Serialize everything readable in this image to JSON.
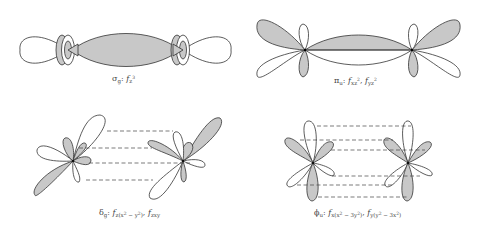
{
  "figure": {
    "type": "molecular-orbital-overlap-diagram",
    "colors": {
      "shaded": "#c8c8c8",
      "outline": "#333333",
      "background": "#ffffff",
      "dashed": "#444444"
    },
    "panels": [
      {
        "id": "sigma-g",
        "symmetry": "σ",
        "symmetry_sub": "g",
        "orbitals": [
          {
            "f": "f",
            "sub": "z",
            "sup": "3"
          }
        ],
        "description": "end-on overlap along the axis"
      },
      {
        "id": "pi-u",
        "symmetry": "π",
        "symmetry_sub": "u",
        "orbitals": [
          {
            "f": "f",
            "sub": "xz",
            "sup": "2"
          },
          {
            "f": "f",
            "sub": "yz",
            "sup": "2"
          }
        ],
        "description": "side-on lobe overlap"
      },
      {
        "id": "delta-g",
        "symmetry": "δ",
        "symmetry_sub": "g",
        "orbitals": [
          {
            "f": "f",
            "sub": "z(x",
            "sup": "2",
            "sub2": " − y",
            "sup2": "2",
            "sub3": ")"
          },
          {
            "f": "f",
            "sub": "zxy"
          }
        ],
        "description": "four dashed overlap lines"
      },
      {
        "id": "phi-u",
        "symmetry": "ϕ",
        "symmetry_sub": "u",
        "orbitals": [
          {
            "f": "f",
            "sub": "x(x",
            "sup": "2",
            "sub2": " − 3y",
            "sup2": "2",
            "sub3": ")"
          },
          {
            "f": "f",
            "sub": "y(y",
            "sup": "2",
            "sub2": " − 3x",
            "sup2": "2",
            "sub3": ")"
          }
        ],
        "description": "six dashed overlap lines"
      }
    ]
  },
  "labels": {
    "sigma": {
      "sym": "σ",
      "symsub": "g",
      "f1": "f",
      "f1sub": "z",
      "f1sup": "3"
    },
    "pi": {
      "sym": "π",
      "symsub": "u",
      "f1": "f",
      "f1sub": "xz",
      "f1sup": "2",
      "sep": ", ",
      "f2": "f",
      "f2sub": "yz",
      "f2sup": "2"
    },
    "delta": {
      "sym": "δ",
      "symsub": "g",
      "f1": "f",
      "f1sub_a": "z(x",
      "f1sup_a": "2",
      "f1sub_b": " − y",
      "f1sup_b": "2",
      "f1sub_c": ")",
      "sep": ", ",
      "f2": "f",
      "f2sub": "zxy"
    },
    "phi": {
      "sym": "ϕ",
      "symsub": "u",
      "f1": "f",
      "f1sub_a": "x(x",
      "f1sup_a": "2",
      "f1sub_b": " − 3y",
      "f1sup_b": "2",
      "f1sub_c": ")",
      "sep": ", ",
      "f2": "f",
      "f2sub_a": "y(y",
      "f2sup_a": "2",
      "f2sub_b": " − 3x",
      "f2sup_b": "2",
      "f2sub_c": ")"
    },
    "colon": ": "
  }
}
